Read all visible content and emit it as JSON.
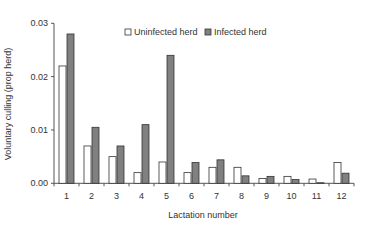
{
  "chart_data": {
    "type": "bar",
    "title": "",
    "xlabel": "Lactation number",
    "ylabel": "Voluntary culling (prop herd)",
    "ylim": [
      0,
      0.03
    ],
    "yticks": [
      "0.00",
      "0.01",
      "0.02",
      "0.03"
    ],
    "grid": false,
    "legend_position": "top-right",
    "categories": [
      "1",
      "2",
      "3",
      "4",
      "5",
      "6",
      "7",
      "8",
      "9",
      "10",
      "11",
      "12"
    ],
    "series": [
      {
        "name": "Uninfected herd",
        "color": "#ffffff",
        "values": [
          0.022,
          0.007,
          0.005,
          0.002,
          0.004,
          0.002,
          0.003,
          0.003,
          0.0009,
          0.0013,
          0.0008,
          0.0039
        ]
      },
      {
        "name": "Infected herd",
        "color": "#808080",
        "values": [
          0.028,
          0.0105,
          0.007,
          0.011,
          0.024,
          0.0039,
          0.0044,
          0.0014,
          0.0013,
          0.0007,
          0.0001,
          0.0019
        ]
      }
    ]
  }
}
